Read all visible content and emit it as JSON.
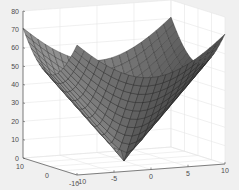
{
  "chart_data": {
    "type": "surface3d",
    "title": "",
    "xlabel": "",
    "ylabel": "",
    "zlabel": "",
    "x_ticks": [
      -10,
      -5,
      0,
      5,
      10
    ],
    "y_ticks": [
      -10,
      0,
      10
    ],
    "z_ticks": [
      0,
      10,
      20,
      30,
      40,
      50,
      60,
      70,
      80
    ],
    "xlim": [
      -10,
      10
    ],
    "ylim": [
      -10,
      10
    ],
    "zlim": [
      0,
      80
    ],
    "grid": true,
    "grid_n": 21,
    "function": "z = 5*sqrt(x^2+y^2)",
    "corner_values": {
      "z_at_corners": 70.7,
      "z_at_center": 0
    },
    "colormap": "gray",
    "edge_color": "#222222"
  },
  "axes": {
    "z_labels": [
      "0",
      "10",
      "20",
      "30",
      "40",
      "50",
      "60",
      "70",
      "80"
    ],
    "y_labels": [
      "10",
      "0",
      "-10"
    ],
    "x_labels": [
      "-10",
      "-5",
      "0",
      "5",
      "10"
    ]
  },
  "colors": {
    "background": "#f0f0f0",
    "axes_bg": "#ffffff",
    "grid": "#e6e6e6",
    "axis": "#4d4d4d"
  }
}
